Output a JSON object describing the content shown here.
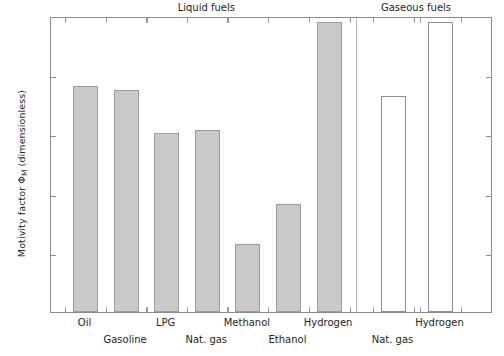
{
  "chart_data": {
    "type": "bar",
    "title": "",
    "xlabel": "",
    "ylabel": "Motivity factor ΦM (dimensionless)",
    "ylabel_main": "Motivity factor Φ",
    "ylabel_sub": "M",
    "ylabel_tail": " (dimensionless)",
    "ylim": [
      0,
      1
    ],
    "yticks": [
      0,
      0.2,
      0.4,
      0.6,
      0.8,
      1
    ],
    "ytick_labels": [
      "0",
      "0.2",
      "0.4",
      "0.6",
      "0.8",
      "1"
    ],
    "grid": false,
    "legend": "none",
    "groups": [
      {
        "name": "Liquid fuels",
        "label": "Liquid fuels"
      },
      {
        "name": "Gaseous fuels",
        "label": "Gaseous fuels"
      }
    ],
    "categories": [
      "Oil",
      "Gasoline",
      "LPG",
      "Nat. gas",
      "Methanol",
      "Ethanol",
      "Hydrogen",
      "Nat. gas",
      "Hydrogen"
    ],
    "values": [
      0.765,
      0.75,
      0.605,
      0.615,
      0.23,
      0.365,
      0.98,
      0.73,
      0.98
    ],
    "bars": [
      {
        "label": "Oil",
        "value": 0.765,
        "group": "Liquid fuels",
        "style": "filled",
        "label_row": 0
      },
      {
        "label": "Gasoline",
        "value": 0.75,
        "group": "Liquid fuels",
        "style": "filled",
        "label_row": 1
      },
      {
        "label": "LPG",
        "value": 0.605,
        "group": "Liquid fuels",
        "style": "filled",
        "label_row": 0
      },
      {
        "label": "Nat. gas",
        "value": 0.615,
        "group": "Liquid fuels",
        "style": "filled",
        "label_row": 1
      },
      {
        "label": "Methanol",
        "value": 0.23,
        "group": "Liquid fuels",
        "style": "filled",
        "label_row": 0
      },
      {
        "label": "Ethanol",
        "value": 0.365,
        "group": "Liquid fuels",
        "style": "filled",
        "label_row": 1
      },
      {
        "label": "Hydrogen",
        "value": 0.98,
        "group": "Liquid fuels",
        "style": "filled",
        "label_row": 0
      },
      {
        "label": "Nat. gas",
        "value": 0.73,
        "group": "Gaseous fuels",
        "style": "open",
        "label_row": 1
      },
      {
        "label": "Hydrogen",
        "value": 0.98,
        "group": "Gaseous fuels",
        "style": "open",
        "label_row": 0
      }
    ],
    "colors": {
      "bar_fill_liquid": "#c9c9c9",
      "bar_fill_gaseous": "#ffffff",
      "bar_edge": "#9b9b9b",
      "axis": "#8a8a8a",
      "text": "#231f20",
      "separator": "#b5b5b5"
    }
  }
}
